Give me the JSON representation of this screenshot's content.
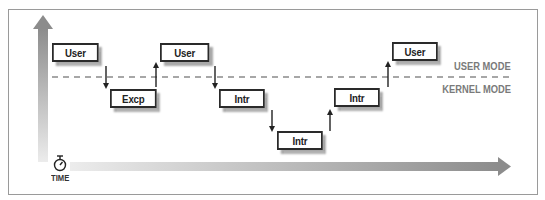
{
  "diagram": {
    "modes": {
      "user_label": "USER MODE",
      "kernel_label": "KERNEL MODE"
    },
    "time_label": "TIME",
    "icons": {
      "time_icon": "stopwatch-icon",
      "vertical_axis": "arrow-up-icon",
      "time_axis": "arrow-right-icon"
    },
    "boxes": [
      {
        "label": "User",
        "level": "user"
      },
      {
        "label": "Excp",
        "level": "kernel-1"
      },
      {
        "label": "User",
        "level": "user"
      },
      {
        "label": "Intr",
        "level": "kernel-1"
      },
      {
        "label": "Intr",
        "level": "kernel-2"
      },
      {
        "label": "Intr",
        "level": "kernel-1"
      },
      {
        "label": "User",
        "level": "user"
      }
    ],
    "transitions": [
      {
        "from": 0,
        "to": 1,
        "direction": "down"
      },
      {
        "from": 1,
        "to": 2,
        "direction": "up"
      },
      {
        "from": 2,
        "to": 3,
        "direction": "down"
      },
      {
        "from": 3,
        "to": 4,
        "direction": "down"
      },
      {
        "from": 4,
        "to": 5,
        "direction": "up"
      },
      {
        "from": 5,
        "to": 6,
        "direction": "up"
      }
    ],
    "colors": {
      "box_border": "#2a2a2a",
      "box_shadow": "#a8a8a8",
      "dashed_line": "#8a8a8a",
      "mode_text": "#7a7a7a",
      "axis_dark": "#8c8c8c",
      "axis_light": "#e6e6e6"
    }
  }
}
